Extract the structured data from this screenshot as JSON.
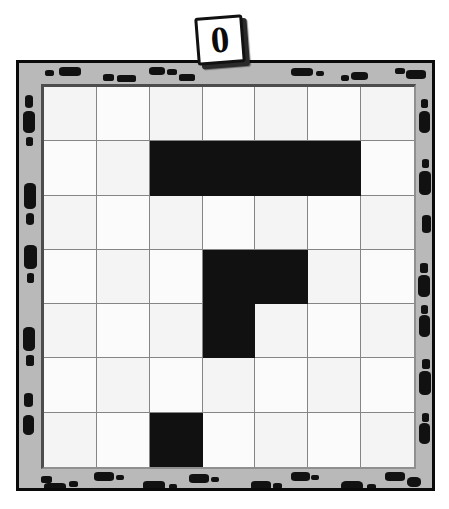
{
  "puzzle": {
    "label_card": {
      "value": "0",
      "rotation_degrees": -4.5
    },
    "frame": {
      "base_color": "#b9b9b9",
      "speckle_color": "#111111",
      "outline_color": "#0a0a0a",
      "pattern_name": "dalmatian-speckle"
    },
    "board": {
      "rows": 7,
      "cols": 7,
      "empty_color": "#fbfbfb",
      "filled_color": "#111111",
      "gridline_color": "#858585",
      "cells": [
        [
          0,
          0,
          0,
          0,
          0,
          0,
          0
        ],
        [
          0,
          0,
          1,
          1,
          1,
          1,
          0
        ],
        [
          0,
          0,
          0,
          0,
          0,
          0,
          0
        ],
        [
          0,
          0,
          0,
          1,
          1,
          0,
          0
        ],
        [
          0,
          0,
          0,
          1,
          0,
          0,
          0
        ],
        [
          0,
          0,
          0,
          0,
          0,
          0,
          0
        ],
        [
          0,
          0,
          1,
          0,
          0,
          0,
          0
        ]
      ],
      "filled_count": 7
    },
    "speckles": {
      "top": [
        {
          "x": 26,
          "y": 7,
          "w": 9,
          "h": 6,
          "r": 3
        },
        {
          "x": 40,
          "y": 4,
          "w": 22,
          "h": 9,
          "r": 4
        },
        {
          "x": 84,
          "y": 11,
          "w": 11,
          "h": 7,
          "r": 3
        },
        {
          "x": 98,
          "y": 12,
          "w": 19,
          "h": 7,
          "r": 3
        },
        {
          "x": 130,
          "y": 4,
          "w": 16,
          "h": 8,
          "r": 4
        },
        {
          "x": 148,
          "y": 6,
          "w": 10,
          "h": 6,
          "r": 3
        },
        {
          "x": 160,
          "y": 11,
          "w": 16,
          "h": 7,
          "r": 3
        },
        {
          "x": 272,
          "y": 5,
          "w": 22,
          "h": 8,
          "r": 4
        },
        {
          "x": 297,
          "y": 8,
          "w": 8,
          "h": 5,
          "r": 2
        },
        {
          "x": 322,
          "y": 12,
          "w": 8,
          "h": 6,
          "r": 3
        },
        {
          "x": 332,
          "y": 9,
          "w": 17,
          "h": 8,
          "r": 4
        },
        {
          "x": 376,
          "y": 5,
          "w": 10,
          "h": 6,
          "r": 3
        },
        {
          "x": 387,
          "y": 7,
          "w": 20,
          "h": 9,
          "r": 4
        }
      ],
      "left": [
        {
          "x": 6,
          "y": 32,
          "w": 8,
          "h": 13,
          "r": 4
        },
        {
          "x": 4,
          "y": 48,
          "w": 12,
          "h": 22,
          "r": 5
        },
        {
          "x": 7,
          "y": 74,
          "w": 7,
          "h": 9,
          "r": 3
        },
        {
          "x": 5,
          "y": 120,
          "w": 12,
          "h": 26,
          "r": 5
        },
        {
          "x": 7,
          "y": 150,
          "w": 8,
          "h": 12,
          "r": 4
        },
        {
          "x": 5,
          "y": 182,
          "w": 13,
          "h": 24,
          "r": 5
        },
        {
          "x": 8,
          "y": 210,
          "w": 7,
          "h": 10,
          "r": 3
        },
        {
          "x": 4,
          "y": 264,
          "w": 12,
          "h": 24,
          "r": 5
        },
        {
          "x": 7,
          "y": 292,
          "w": 8,
          "h": 11,
          "r": 3
        },
        {
          "x": 5,
          "y": 330,
          "w": 9,
          "h": 14,
          "r": 4
        },
        {
          "x": 4,
          "y": 352,
          "w": 11,
          "h": 20,
          "r": 5
        }
      ],
      "right": [
        {
          "x": 402,
          "y": 36,
          "w": 7,
          "h": 9,
          "r": 3
        },
        {
          "x": 400,
          "y": 48,
          "w": 11,
          "h": 22,
          "r": 5
        },
        {
          "x": 403,
          "y": 96,
          "w": 7,
          "h": 9,
          "r": 3
        },
        {
          "x": 400,
          "y": 108,
          "w": 12,
          "h": 24,
          "r": 5
        },
        {
          "x": 403,
          "y": 152,
          "w": 9,
          "h": 18,
          "r": 4
        },
        {
          "x": 401,
          "y": 200,
          "w": 8,
          "h": 10,
          "r": 3
        },
        {
          "x": 399,
          "y": 212,
          "w": 12,
          "h": 22,
          "r": 5
        },
        {
          "x": 402,
          "y": 242,
          "w": 7,
          "h": 9,
          "r": 3
        },
        {
          "x": 400,
          "y": 252,
          "w": 11,
          "h": 22,
          "r": 5
        },
        {
          "x": 403,
          "y": 296,
          "w": 8,
          "h": 10,
          "r": 3
        },
        {
          "x": 400,
          "y": 308,
          "w": 12,
          "h": 24,
          "r": 5
        },
        {
          "x": 403,
          "y": 350,
          "w": 7,
          "h": 9,
          "r": 3
        },
        {
          "x": 400,
          "y": 360,
          "w": 11,
          "h": 21,
          "r": 5
        }
      ],
      "bottom": [
        {
          "x": 22,
          "y": 413,
          "w": 11,
          "h": 7,
          "r": 3
        },
        {
          "x": 25,
          "y": 420,
          "w": 22,
          "h": 9,
          "r": 4
        },
        {
          "x": 50,
          "y": 418,
          "w": 9,
          "h": 6,
          "r": 3
        },
        {
          "x": 75,
          "y": 409,
          "w": 20,
          "h": 9,
          "r": 4
        },
        {
          "x": 97,
          "y": 412,
          "w": 8,
          "h": 5,
          "r": 2
        },
        {
          "x": 124,
          "y": 418,
          "w": 22,
          "h": 9,
          "r": 4
        },
        {
          "x": 150,
          "y": 421,
          "w": 8,
          "h": 5,
          "r": 2
        },
        {
          "x": 170,
          "y": 411,
          "w": 20,
          "h": 9,
          "r": 4
        },
        {
          "x": 192,
          "y": 414,
          "w": 8,
          "h": 5,
          "r": 2
        },
        {
          "x": 232,
          "y": 418,
          "w": 20,
          "h": 9,
          "r": 4
        },
        {
          "x": 254,
          "y": 420,
          "w": 9,
          "h": 6,
          "r": 3
        },
        {
          "x": 272,
          "y": 409,
          "w": 19,
          "h": 9,
          "r": 4
        },
        {
          "x": 292,
          "y": 412,
          "w": 8,
          "h": 5,
          "r": 2
        },
        {
          "x": 322,
          "y": 418,
          "w": 22,
          "h": 10,
          "r": 5
        },
        {
          "x": 348,
          "y": 421,
          "w": 9,
          "h": 6,
          "r": 3
        },
        {
          "x": 366,
          "y": 409,
          "w": 20,
          "h": 9,
          "r": 4
        },
        {
          "x": 388,
          "y": 414,
          "w": 14,
          "h": 10,
          "r": 5
        }
      ]
    }
  }
}
